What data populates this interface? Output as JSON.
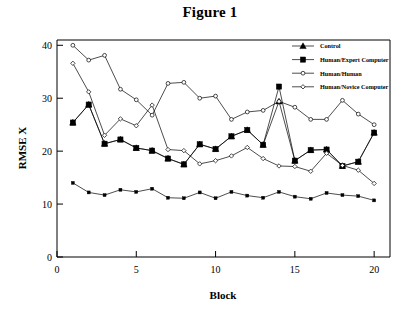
{
  "figure": {
    "title": "Figure 1"
  },
  "chart_data": {
    "type": "line",
    "title": "Figure 1",
    "xlabel": "Block",
    "ylabel": "RMSE  X",
    "xlim": [
      0,
      21
    ],
    "ylim": [
      0,
      41
    ],
    "xticks": [
      0,
      5,
      10,
      15,
      20
    ],
    "yticks": [
      0,
      10,
      20,
      30,
      40
    ],
    "xtick_labels": [
      "0",
      "5",
      "10",
      "15",
      "20"
    ],
    "ytick_labels": [
      "0",
      "10",
      "20",
      "30",
      "40"
    ],
    "grid": false,
    "legend_position": "top-right",
    "x": [
      1,
      2,
      3,
      4,
      5,
      6,
      7,
      8,
      9,
      10,
      11,
      12,
      13,
      14,
      15,
      16,
      17,
      18,
      19,
      20
    ],
    "series": [
      {
        "name": "Control",
        "marker": "filled-triangle",
        "values": [
          25.4,
          28.8,
          21.4,
          22.2,
          20.6,
          20.1,
          18.6,
          17.5,
          21.3,
          20.4,
          22.8,
          24.0,
          21.2,
          29.4,
          18.2,
          20.2,
          20.3,
          17.2,
          18.0,
          23.5
        ]
      },
      {
        "name": "Human/Expert Computer",
        "marker": "filled-square",
        "values": [
          25.4,
          28.8,
          21.4,
          22.2,
          20.6,
          20.1,
          18.6,
          17.5,
          21.3,
          20.4,
          22.8,
          24.0,
          21.2,
          32.2,
          18.2,
          20.2,
          20.3,
          17.2,
          18.0,
          23.5
        ]
      },
      {
        "name": "Human/Human",
        "marker": "open-circle",
        "values": [
          40.0,
          37.2,
          38.1,
          31.7,
          29.7,
          26.8,
          32.8,
          33.0,
          30.0,
          30.4,
          26.0,
          27.4,
          27.7,
          29.4,
          28.3,
          26.0,
          26.0,
          29.6,
          27.0,
          25.0
        ]
      },
      {
        "name": "Human/Novice Computer",
        "marker": "open-diamond",
        "values": [
          36.6,
          31.2,
          23.0,
          26.1,
          24.8,
          28.7,
          20.3,
          20.1,
          17.6,
          18.2,
          19.1,
          20.7,
          18.6,
          17.2,
          17.1,
          16.2,
          19.6,
          17.3,
          16.4,
          13.9
        ]
      },
      {
        "name": "Lower band",
        "marker": "filled-square-small",
        "values": [
          14.0,
          12.2,
          11.7,
          12.7,
          12.3,
          12.9,
          11.2,
          11.1,
          12.2,
          11.1,
          12.3,
          11.6,
          11.2,
          12.3,
          11.4,
          11.0,
          12.1,
          11.7,
          11.5,
          10.7
        ]
      }
    ],
    "legend_entries": [
      {
        "label": "Control",
        "marker": "filled-triangle"
      },
      {
        "label": "Human/Expert Computer",
        "marker": "filled-square"
      },
      {
        "label": "Human/Human",
        "marker": "open-circle"
      },
      {
        "label": "Human/Novice Computer",
        "marker": "open-diamond"
      }
    ]
  }
}
